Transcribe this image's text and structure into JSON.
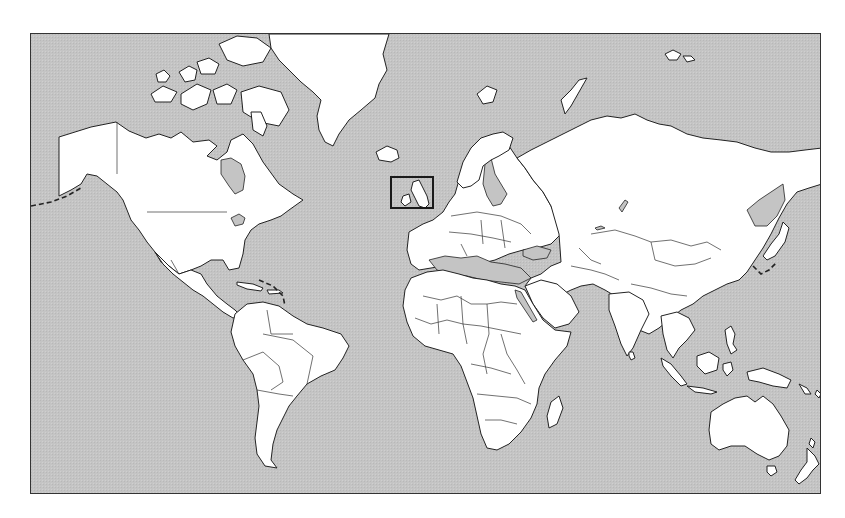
{
  "map": {
    "projection": "Mercator",
    "style": "blank political outline map",
    "frame": {
      "x": 30,
      "y": 33,
      "width": 791,
      "height": 461
    },
    "colors": {
      "ocean": "#c4c4c4",
      "land": "#ffffff",
      "outline": "#222222",
      "highlight": "#1a1a1a"
    },
    "highlight": {
      "region": "British Isles",
      "x": 390,
      "y": 176,
      "width": 44,
      "height": 33
    },
    "landmasses": [
      "North America",
      "Greenland",
      "Canadian Arctic Archipelago",
      "Iceland",
      "South America",
      "Europe",
      "Africa",
      "Madagascar",
      "Asia",
      "Japan",
      "Indonesia",
      "Philippines",
      "New Guinea",
      "Australia",
      "Tasmania",
      "New Zealand",
      "Svalbard",
      "Franz Josef Land",
      "Novaya Zemlya",
      "Sri Lanka"
    ]
  }
}
